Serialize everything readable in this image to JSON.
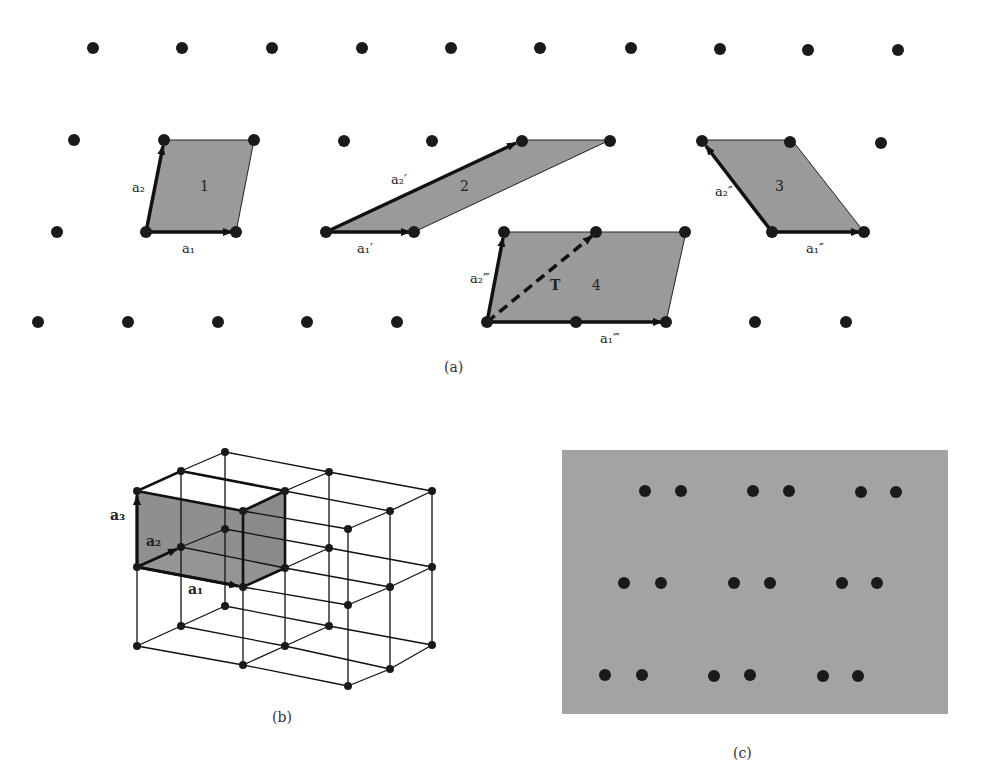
{
  "figure": {
    "panel_a": {
      "caption": "(a)",
      "cells": [
        {
          "id": "1",
          "label": "1",
          "vector_labels": [
            "a₁",
            "a₂"
          ]
        },
        {
          "id": "2",
          "label": "2",
          "vector_labels": [
            "a₁′",
            "a₂′"
          ]
        },
        {
          "id": "3",
          "label": "3",
          "vector_labels": [
            "a₁″",
            "a₂″"
          ]
        },
        {
          "id": "4",
          "label": "4",
          "vector_labels": [
            "a₁‴",
            "a₂‴"
          ],
          "translation_label": "T"
        }
      ]
    },
    "panel_b": {
      "caption": "(b)",
      "vector_labels": [
        "a₁",
        "a₂",
        "a₃"
      ]
    },
    "panel_c": {
      "caption": "(c)",
      "rows": 3,
      "pairs_per_row": 3
    },
    "colors": {
      "cell_fill": "#9a9a9a",
      "panel_c_fill": "#a3a3a3",
      "point": "#1a1a1a",
      "line": "#111111"
    }
  }
}
